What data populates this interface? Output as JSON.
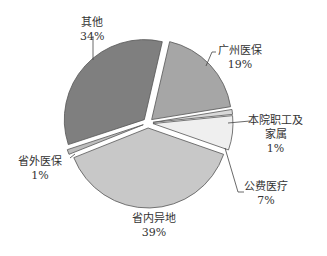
{
  "chart_data": {
    "type": "pie",
    "title": "",
    "exploded": true,
    "slices": [
      {
        "label": "广州医保",
        "value": 19,
        "display": "19%",
        "color": "#a6a6a6"
      },
      {
        "label": "本院职工及家属",
        "value": 1,
        "display": "1%",
        "color": "#d9d9d9"
      },
      {
        "label": "公费医疗",
        "value": 7,
        "display": "7%",
        "color": "#efefef"
      },
      {
        "label": "省内异地",
        "value": 39,
        "display": "39%",
        "color": "#c8c8c8"
      },
      {
        "label": "省外医保",
        "value": 1,
        "display": "1%",
        "color": "#bdbdbd"
      },
      {
        "label": "其他",
        "value": 34,
        "display": "34%",
        "color": "#7f7f7f"
      }
    ]
  },
  "labels": {
    "other": {
      "name": "其他",
      "pct": "34%"
    },
    "guangzhou": {
      "name": "广州医保",
      "pct": "19%"
    },
    "staff": {
      "name1": "本院职工及",
      "name2": "家属",
      "pct": "1%"
    },
    "public": {
      "name": "公费医疗",
      "pct": "7%"
    },
    "inprov": {
      "name": "省内异地",
      "pct": "39%"
    },
    "outprov": {
      "name": "省外医保",
      "pct": "1%"
    }
  }
}
